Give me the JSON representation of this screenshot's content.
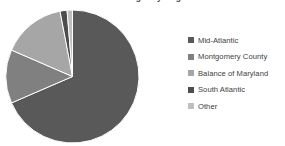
{
  "chart_data": {
    "type": "pie",
    "title": "Patient Origin by Region",
    "categories": [
      "Mid-Atlantic",
      "Montgomery County",
      "Balance of Maryland",
      "South Atlantic",
      "Other"
    ],
    "values": [
      68.5,
      13.0,
      15.5,
      1.7,
      1.3
    ],
    "colors": [
      "#595959",
      "#808080",
      "#a6a6a6",
      "#4d4d4d",
      "#bfbfbf"
    ],
    "start_angle_deg": -90,
    "legend_position": "right",
    "grid": false,
    "xlabel": "",
    "ylabel": ""
  },
  "legend": {
    "items": [
      {
        "label": "Mid-Atlantic",
        "color": "#595959"
      },
      {
        "label": "Montgomery County",
        "color": "#808080"
      },
      {
        "label": "Balance of Maryland",
        "color": "#a6a6a6"
      },
      {
        "label": "South Atlantic",
        "color": "#4d4d4d"
      },
      {
        "label": "Other",
        "color": "#bfbfbf"
      }
    ]
  },
  "pie": {
    "center_x": 72.5,
    "center_y": 76.5,
    "radius": 66.5,
    "stroke": "#ffffff",
    "stroke_width": 1
  }
}
